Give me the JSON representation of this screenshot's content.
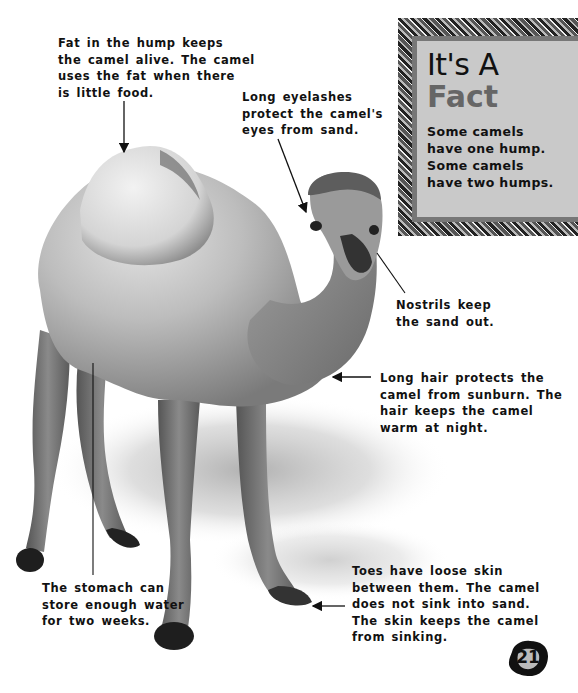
{
  "page": {
    "page_number": "21"
  },
  "fact_box": {
    "title_line1": "It's A",
    "title_line2": "Fact",
    "text_lines": [
      "Some camels",
      "have one hump.",
      "Some camels",
      "have two humps."
    ]
  },
  "annotations": {
    "hump": {
      "lines": [
        "Fat in the hump keeps",
        "the camel alive. The camel",
        "uses the fat when there",
        "is little food."
      ]
    },
    "eyelashes": {
      "lines": [
        "Long eyelashes",
        "protect the camel's",
        "eyes from sand."
      ]
    },
    "nostrils": {
      "lines": [
        "Nostrils keep",
        "the sand out."
      ]
    },
    "hair": {
      "lines": [
        "Long hair protects the",
        "camel from sunburn. The",
        "hair keeps the camel",
        "warm at night."
      ]
    },
    "stomach": {
      "lines": [
        "The stomach can",
        "store enough water",
        "for two weeks."
      ]
    },
    "toes": {
      "lines": [
        "Toes have loose skin",
        "between them. The camel",
        "does not sink into sand.",
        "The skin keeps the camel",
        "from sinking."
      ]
    }
  }
}
